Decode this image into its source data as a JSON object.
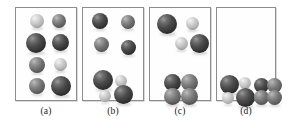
{
  "figure": {
    "width": 288,
    "height": 128,
    "background": "#ffffff",
    "border_color": "#8d8d8d",
    "colors": {
      "dark_sphere": "#3a3a3a",
      "mid_sphere": "#6f6f6f",
      "light_sphere": "#d8d8d8",
      "panel_border": "#8d8d8d",
      "caption_text": "#1a1a1a"
    }
  },
  "panels": [
    {
      "id": "a",
      "caption": "(a)",
      "box": {
        "x": 15,
        "y": 7,
        "w": 62,
        "h": 94
      },
      "caption_box": {
        "x": 15,
        "y": 106,
        "w": 62
      },
      "spheres": [
        {
          "name": "sphere-a1",
          "cx": 21,
          "cy": 13,
          "r": 7,
          "shade": "light"
        },
        {
          "name": "sphere-a2",
          "cx": 43,
          "cy": 13,
          "r": 7,
          "shade": "mid"
        },
        {
          "name": "sphere-a3",
          "cx": 20,
          "cy": 35,
          "r": 10,
          "shade": "dark"
        },
        {
          "name": "sphere-a4",
          "cx": 44,
          "cy": 34,
          "r": 8.5,
          "shade": "dark"
        },
        {
          "name": "sphere-a5",
          "cx": 21,
          "cy": 57,
          "r": 8,
          "shade": "mid"
        },
        {
          "name": "sphere-a6",
          "cx": 44,
          "cy": 56,
          "r": 6.5,
          "shade": "light"
        },
        {
          "name": "sphere-a7",
          "cx": 21,
          "cy": 78,
          "r": 8,
          "shade": "mid"
        },
        {
          "name": "sphere-a8",
          "cx": 45,
          "cy": 78,
          "r": 10,
          "shade": "dark"
        }
      ]
    },
    {
      "id": "b",
      "caption": "(b)",
      "box": {
        "x": 82,
        "y": 7,
        "w": 62,
        "h": 94
      },
      "caption_box": {
        "x": 82,
        "y": 106,
        "w": 62
      },
      "spheres": [
        {
          "name": "sphere-b1",
          "cx": 17,
          "cy": 13,
          "r": 8,
          "shade": "dark"
        },
        {
          "name": "sphere-b2",
          "cx": 45,
          "cy": 14,
          "r": 7,
          "shade": "mid"
        },
        {
          "name": "sphere-b3",
          "cx": 18,
          "cy": 36,
          "r": 7.5,
          "shade": "mid"
        },
        {
          "name": "sphere-b4",
          "cx": 45,
          "cy": 39,
          "r": 7.5,
          "shade": "dark"
        },
        {
          "name": "sphere-b5",
          "cx": 20,
          "cy": 72,
          "r": 10,
          "shade": "dark"
        },
        {
          "name": "sphere-b6",
          "cx": 38,
          "cy": 73,
          "r": 6,
          "shade": "light"
        },
        {
          "name": "sphere-b7",
          "cx": 22,
          "cy": 88,
          "r": 6,
          "shade": "light"
        },
        {
          "name": "sphere-b8",
          "cx": 40,
          "cy": 86,
          "r": 9.5,
          "shade": "dark"
        }
      ]
    },
    {
      "id": "c",
      "caption": "(c)",
      "box": {
        "x": 149,
        "y": 7,
        "w": 62,
        "h": 94
      },
      "caption_box": {
        "x": 149,
        "y": 106,
        "w": 62
      },
      "spheres": [
        {
          "name": "sphere-c1",
          "cx": 17,
          "cy": 16,
          "r": 10,
          "shade": "dark"
        },
        {
          "name": "sphere-c2",
          "cx": 42,
          "cy": 15,
          "r": 6.5,
          "shade": "light"
        },
        {
          "name": "sphere-c3",
          "cx": 31,
          "cy": 35,
          "r": 6.5,
          "shade": "light"
        },
        {
          "name": "sphere-c4",
          "cx": 49,
          "cy": 35,
          "r": 9.5,
          "shade": "dark"
        },
        {
          "name": "sphere-c5",
          "cx": 22,
          "cy": 74,
          "r": 8.5,
          "shade": "dark"
        },
        {
          "name": "sphere-c6",
          "cx": 39,
          "cy": 74,
          "r": 8.5,
          "shade": "mid"
        },
        {
          "name": "sphere-c7",
          "cx": 22,
          "cy": 88,
          "r": 8.5,
          "shade": "mid"
        },
        {
          "name": "sphere-c8",
          "cx": 39,
          "cy": 88,
          "r": 8.5,
          "shade": "mid"
        }
      ]
    },
    {
      "id": "d",
      "caption": "(d)",
      "box": {
        "x": 216,
        "y": 7,
        "w": 60,
        "h": 94
      },
      "caption_box": {
        "x": 216,
        "y": 106,
        "w": 60
      },
      "spheres": [
        {
          "name": "sphere-d1",
          "cx": 12,
          "cy": 76,
          "r": 9.5,
          "shade": "dark"
        },
        {
          "name": "sphere-d2",
          "cx": 28,
          "cy": 75,
          "r": 6,
          "shade": "light"
        },
        {
          "name": "sphere-d3",
          "cx": 11,
          "cy": 90,
          "r": 6,
          "shade": "light"
        },
        {
          "name": "sphere-d4",
          "cx": 28,
          "cy": 89,
          "r": 9.5,
          "shade": "dark"
        },
        {
          "name": "sphere-d5",
          "cx": 44,
          "cy": 77,
          "r": 7.5,
          "shade": "dark"
        },
        {
          "name": "sphere-d6",
          "cx": 57,
          "cy": 77,
          "r": 7.5,
          "shade": "mid"
        },
        {
          "name": "sphere-d7",
          "cx": 44,
          "cy": 89,
          "r": 7.5,
          "shade": "mid"
        },
        {
          "name": "sphere-d8",
          "cx": 57,
          "cy": 89,
          "r": 7.5,
          "shade": "mid"
        }
      ]
    }
  ]
}
